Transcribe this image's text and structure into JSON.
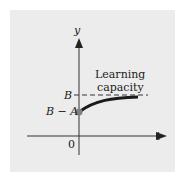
{
  "diagram": {
    "axes": {
      "x_label": "t",
      "y_label": "y",
      "origin_label": "0"
    },
    "levels": {
      "upper": "B",
      "lower": "B − A"
    },
    "annotation": [
      "Learning",
      "capacity"
    ],
    "colors": {
      "background": "#ececec",
      "curve": "#1a1a1a",
      "dot": "#808080"
    }
  }
}
